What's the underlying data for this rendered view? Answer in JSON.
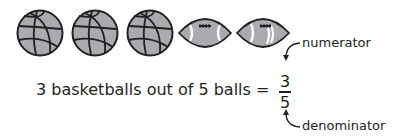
{
  "figure": {
    "balls": [
      {
        "type": "basketball"
      },
      {
        "type": "basketball"
      },
      {
        "type": "basketball"
      },
      {
        "type": "football"
      },
      {
        "type": "football"
      }
    ],
    "equation_text": "3 basketballs out of 5 balls =",
    "fraction": {
      "numerator": "3",
      "denominator": "5"
    },
    "labels": {
      "numerator": "numerator",
      "denominator": "denominator"
    },
    "colors": {
      "ball_fill": "#a7a9ac",
      "outline": "#231f20",
      "text": "#231f20",
      "stripe": "#ffffff"
    }
  }
}
